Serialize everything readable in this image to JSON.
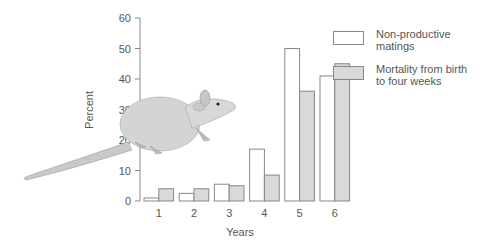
{
  "chart_data": {
    "type": "bar",
    "title": "",
    "xlabel": "Years",
    "ylabel": "Percent",
    "ylim": [
      0,
      60
    ],
    "yticks": [
      0,
      10,
      20,
      30,
      40,
      50,
      60
    ],
    "grid": false,
    "legend_position": "right",
    "categories": [
      "1",
      "2",
      "3",
      "4",
      "5",
      "6"
    ],
    "series": [
      {
        "name": "Non-productive matings",
        "color": "#ffffff",
        "values": [
          1,
          2.5,
          5.5,
          17,
          50,
          41
        ]
      },
      {
        "name": "Mortality from birth to four weeks",
        "color": "#d9d9d9",
        "values": [
          4,
          4,
          5,
          8.5,
          36,
          45
        ]
      }
    ],
    "annotations": [
      "illustration of a rat"
    ]
  },
  "legend": {
    "items": [
      {
        "line1": "Non-productive",
        "line2": "matings",
        "color": "#ffffff"
      },
      {
        "line1": "Mortality from birth",
        "line2": "to four weeks",
        "color": "#d9d9d9"
      }
    ]
  },
  "axes": {
    "x_label": "Years",
    "y_label": "Percent"
  }
}
